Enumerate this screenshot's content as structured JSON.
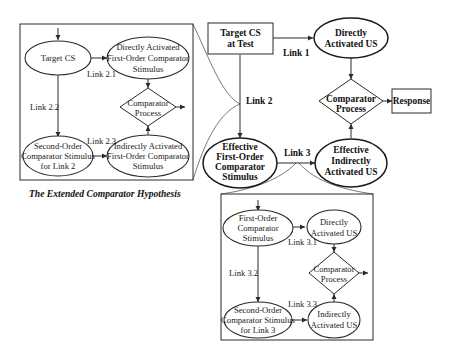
{
  "title": "The Extended Comparator Hypothesis",
  "main": {
    "target_cs": [
      "Target CS",
      "at Test"
    ],
    "direct_us": [
      "Directly",
      "Activated US"
    ],
    "comparator": [
      "Comparator",
      "Process"
    ],
    "response": "Response",
    "effective_first": [
      "Effective",
      "First-Order",
      "Comparator",
      "Stimulus"
    ],
    "effective_indirect": [
      "Effective",
      "Indirectly",
      "Activated US"
    ],
    "link1": "Link 1",
    "link2": "Link 2",
    "link3": "Link 3"
  },
  "link2_panel": {
    "target_cs": "Target CS",
    "direct_first": [
      "Directly Activated",
      "First-Order Comparator",
      "Stimulus"
    ],
    "comparator": [
      "Comparator",
      "Process"
    ],
    "second_order": [
      "Second-Order",
      "Comparator Stimulus",
      "for Link 2"
    ],
    "indirect_first": [
      "Indirectly Activated",
      "First-Order Comparator",
      "Stimulus"
    ],
    "link_2_1": "Link 2.1",
    "link_2_2": "Link 2.2",
    "link_2_3": "Link 2.3"
  },
  "link3_panel": {
    "first_order": [
      "First-Order",
      "Comparator",
      "Stimulus"
    ],
    "direct_us": [
      "Directly",
      "Activated US"
    ],
    "comparator": [
      "Comparator",
      "Process"
    ],
    "second_order": [
      "Second-Order",
      "Comparator Stimulus",
      "for Link 3"
    ],
    "indirect_us": [
      "Indirectly",
      "Activated US"
    ],
    "link_3_1": "Link 3.1",
    "link_3_2": "Link 3.2",
    "link_3_3": "Link 3.3"
  },
  "colors": {
    "stroke": "#2a2a2a",
    "background": "#ffffff",
    "text": "#1a1a1a"
  }
}
